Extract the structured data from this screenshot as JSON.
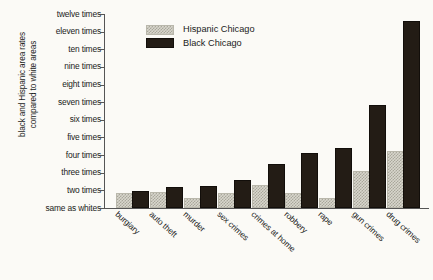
{
  "chart_data": {
    "type": "bar",
    "title": "",
    "xlabel": "",
    "ylabel": "black and Hispanic area rates\ncompared to white areas",
    "categories": [
      "burgiary",
      "auto theft",
      "murder",
      "sex crimes",
      "crimes at home",
      "robbery",
      "rape",
      "gun crimes",
      "drug crimes"
    ],
    "series": [
      {
        "name": "Hispanic Chicago",
        "color": "#d8d6cc",
        "values": [
          1.75,
          1.8,
          1.45,
          1.75,
          2.2,
          1.75,
          1.45,
          3.0,
          4.1
        ]
      },
      {
        "name": "Black Chicago",
        "color": "#231c15",
        "values": [
          1.85,
          2.1,
          2.15,
          2.45,
          3.4,
          4.0,
          4.3,
          6.7,
          11.5
        ]
      }
    ],
    "ytick_values": [
      1,
      2,
      3,
      4,
      5,
      6,
      7,
      8,
      9,
      10,
      11,
      12
    ],
    "ytick_labels": [
      "same as whites",
      "two times",
      "three times",
      "four times",
      "five times",
      "six times",
      "seven times",
      "eight times",
      "nine times",
      "ten times",
      "eleven times",
      "twelve times"
    ],
    "ylim": [
      1,
      12
    ],
    "grid": false,
    "legend_position": "top-left-inside"
  },
  "legend": {
    "entries": [
      {
        "label": "Hispanic Chicago",
        "swatch": "hatched-light"
      },
      {
        "label": "Black Chicago",
        "swatch": "solid-black"
      }
    ]
  },
  "axes": {
    "y_title": "black and Hispanic area rates\ncompared to white areas"
  }
}
